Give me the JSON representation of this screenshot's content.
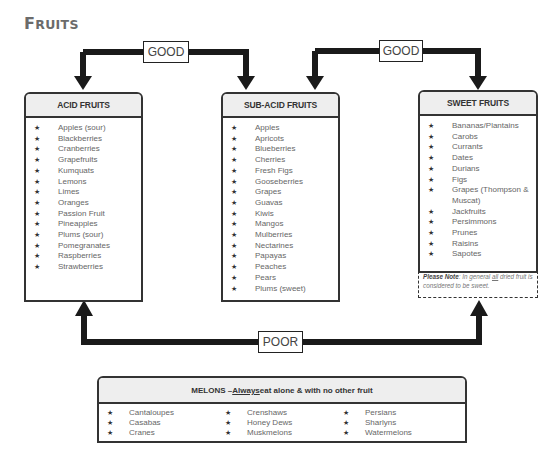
{
  "page": {
    "title_first": "F",
    "title_rest": "RUITS"
  },
  "connectors": {
    "good_1": "GOOD",
    "good_2": "GOOD",
    "poor": "POOR"
  },
  "acid": {
    "header": "ACID FRUITS",
    "items": [
      "Apples (sour)",
      "Blackberries",
      "Cranberries",
      "Grapefruits",
      "Kumquats",
      "Lemons",
      "Limes",
      "Oranges",
      "Passion Fruit",
      "Pineapples",
      "Plums (sour)",
      "Pomegranates",
      "Raspberries",
      "Strawberries"
    ]
  },
  "subacid": {
    "header": "SUB-ACID FRUITS",
    "items": [
      "Apples",
      "Apricots",
      "Blueberries",
      "Cherries",
      "Fresh Figs",
      "Gooseberries",
      "Grapes",
      "Guavas",
      "Kiwis",
      "Mangos",
      "Mulberries",
      "Nectarines",
      "Papayas",
      "Peaches",
      "Pears",
      "Plums (sweet)"
    ]
  },
  "sweet": {
    "header": "SWEET FRUITS",
    "items": [
      "Bananas/Plantains",
      "Carobs",
      "Currants",
      "Dates",
      "Durians",
      "Figs",
      "Grapes (Thompson & Muscat)",
      "Jackfruits",
      "Persimmons",
      "Prunes",
      "Raisins",
      "Sapotes"
    ],
    "note_label": "Please Note",
    "note_pre": ": In general ",
    "note_emph": "all",
    "note_post": " dried fruit is considered to be sweet."
  },
  "melons": {
    "header_pre": "MELONS – ",
    "header_emph": "Always",
    "header_post": " eat alone & with no other fruit",
    "columns": [
      [
        "Cantaloupes",
        "Casabas",
        "Cranes"
      ],
      [
        "Crenshaws",
        "Honey Dews",
        "Muskmelons"
      ],
      [
        "Persians",
        "Sharlyns",
        "Watermelons"
      ]
    ]
  },
  "icons": {
    "bullet": "★"
  },
  "colors": {
    "arrow": "#1a1a1a",
    "header_bg": "#eeeeee",
    "title": "#6b6b6b"
  }
}
